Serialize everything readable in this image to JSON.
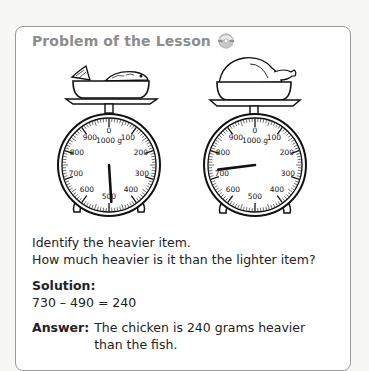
{
  "header": {
    "title": "Problem of the Lesson",
    "icon": "cd-audio-icon"
  },
  "scales": [
    {
      "item": "fish",
      "unit_label": "1000 g",
      "dial_labels": [
        "0",
        "100",
        "200",
        "300",
        "400",
        "500",
        "600",
        "700",
        "800",
        "900"
      ],
      "reading_g": 490
    },
    {
      "item": "chicken",
      "unit_label": "1000 g",
      "dial_labels": [
        "0",
        "100",
        "200",
        "300",
        "400",
        "500",
        "600",
        "700",
        "800",
        "900"
      ],
      "reading_g": 730
    }
  ],
  "question": {
    "line1": "Identify the heavier item.",
    "line2": "How much heavier is it than the lighter item?"
  },
  "solution": {
    "label": "Solution:",
    "equation": "730 – 490 = 240"
  },
  "answer": {
    "label": "Answer:",
    "line1": "The chicken is 240 grams heavier",
    "line2": "than the fish."
  }
}
